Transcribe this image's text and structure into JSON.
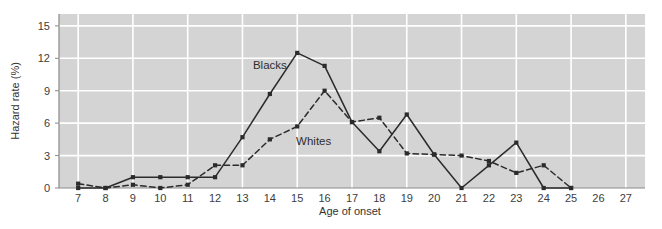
{
  "chart_data": {
    "type": "line",
    "title": "",
    "subtitle": "",
    "xlabel": "Age of onset",
    "ylabel": "Hazard rate (%)",
    "x": [
      7,
      8,
      9,
      10,
      11,
      12,
      13,
      14,
      15,
      16,
      17,
      18,
      19,
      20,
      21,
      22,
      23,
      24,
      25,
      26,
      27
    ],
    "xtick_labels": [
      "7",
      "8",
      "9",
      "10",
      "11",
      "12",
      "13",
      "14",
      "15",
      "16",
      "17",
      "18",
      "19",
      "20",
      "21",
      "22",
      "23",
      "24",
      "25",
      "26",
      "27"
    ],
    "ytick_labels": [
      "0",
      "3",
      "6",
      "9",
      "12",
      "15"
    ],
    "yticks": [
      0,
      3,
      6,
      9,
      12,
      15
    ],
    "xlim": [
      6.3,
      27.7
    ],
    "ylim": [
      0,
      16.1
    ],
    "grid": true,
    "grid_color": "#ffffff",
    "plot_background": "#d4d4d4",
    "legend": "inline-annotations",
    "series": [
      {
        "name": "Blacks",
        "style": "solid",
        "color": "#2b2b2b",
        "marker": "square",
        "label_x": 14.0,
        "label_y": 11.0,
        "x": [
          7,
          8,
          9,
          10,
          11,
          12,
          13,
          14,
          15,
          16,
          17,
          18,
          19,
          20,
          21,
          22,
          23,
          24,
          25
        ],
        "values": [
          0,
          0,
          1.0,
          1.0,
          1.0,
          1.0,
          4.7,
          8.7,
          12.5,
          11.3,
          6.1,
          3.4,
          6.8,
          3.1,
          0,
          2.1,
          4.2,
          0,
          0
        ]
      },
      {
        "name": "Whites",
        "style": "dashed",
        "color": "#2b2b2b",
        "marker": "square",
        "label_x": 15.6,
        "label_y": 4.0,
        "x": [
          7,
          8,
          9,
          10,
          11,
          12,
          13,
          14,
          15,
          16,
          17,
          18,
          19,
          20,
          21,
          22,
          23,
          24,
          25
        ],
        "values": [
          0.4,
          0,
          0.3,
          0,
          0.3,
          2.1,
          2.1,
          4.5,
          5.7,
          9.0,
          6.1,
          6.5,
          3.2,
          3.1,
          3.0,
          2.5,
          1.4,
          2.1,
          0
        ]
      }
    ]
  },
  "axes": {
    "y_title": "Hazard rate (%)",
    "x_title": "Age of onset"
  },
  "annotations": {
    "blacks_label": "Blacks",
    "whites_label": "Whites"
  }
}
